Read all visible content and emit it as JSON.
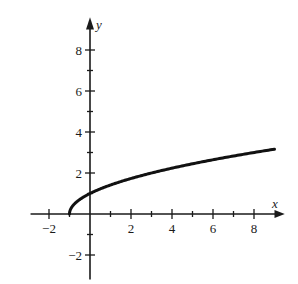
{
  "chart_data": {
    "type": "line",
    "title": "",
    "xlabel": "x",
    "ylabel": "y",
    "function": "y = sqrt(x + 1)",
    "xlim": [
      -3,
      9.5
    ],
    "ylim": [
      -3,
      9.5
    ],
    "x_ticks_labeled": [
      -2,
      2,
      4,
      6,
      8
    ],
    "y_ticks_labeled": [
      -2,
      2,
      4,
      6,
      8
    ],
    "x_tick_labels": [
      "−2",
      "2",
      "4",
      "6",
      "8"
    ],
    "y_tick_labels": [
      "−2",
      "2",
      "4",
      "6",
      "8"
    ],
    "minor_tick_step": 1,
    "grid": false,
    "legend": null,
    "series": [
      {
        "name": "curve",
        "x": [
          -1,
          -0.75,
          -0.5,
          0,
          1,
          2,
          3,
          4,
          5,
          6,
          7,
          8,
          9
        ],
        "y": [
          0,
          0.5,
          0.71,
          1,
          1.41,
          1.73,
          2,
          2.24,
          2.45,
          2.65,
          2.83,
          3,
          3.16
        ]
      }
    ],
    "colors": {
      "axis": "#1a1a1a",
      "curve": "#111111"
    }
  }
}
